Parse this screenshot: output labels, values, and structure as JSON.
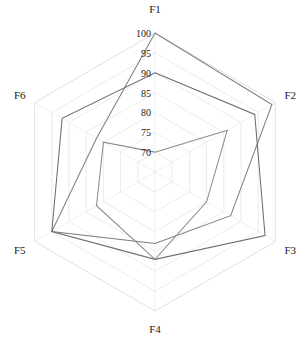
{
  "chart_data": {
    "type": "radar",
    "title": "",
    "xlabel": "",
    "ylabel": "",
    "categories": [
      "F1",
      "F2",
      "F3",
      "F4",
      "F5",
      "F6"
    ],
    "rlim": [
      70,
      100
    ],
    "r_ticks": [
      70,
      75,
      80,
      85,
      90,
      95,
      100
    ],
    "r_tick_labels": [
      "70",
      "75",
      "80",
      "85",
      "90",
      "95",
      "100"
    ],
    "grid": true,
    "legend": "none",
    "series": [
      {
        "name": "Series 1",
        "color": "#808080",
        "values": [
          100,
          99,
          87,
          83,
          95,
          82
        ]
      },
      {
        "name": "Series 2",
        "color": "#6e6e6e",
        "values": [
          90,
          94,
          97,
          87,
          95,
          92
        ]
      },
      {
        "name": "Series 3",
        "color": "#8a8a8a",
        "values": [
          70,
          86,
          80,
          87,
          82,
          80
        ]
      }
    ]
  },
  "axis_labels": {
    "f1": "F1",
    "f2": "F2",
    "f3": "F3",
    "f4": "F4",
    "f5": "F5",
    "f6": "F6"
  },
  "tick_labels": {
    "t100": "100",
    "t95": "95",
    "t90": "90",
    "t85": "85",
    "t80": "80",
    "t75": "75",
    "t70": "70"
  },
  "colors": {
    "background": "#ffffff",
    "grid": "#e6e6e6",
    "grid_outer": "#dddddd",
    "text": "#1a1a1a",
    "series_1": "#808080",
    "series_2": "#6e6e6e",
    "series_3": "#8a8a8a"
  }
}
